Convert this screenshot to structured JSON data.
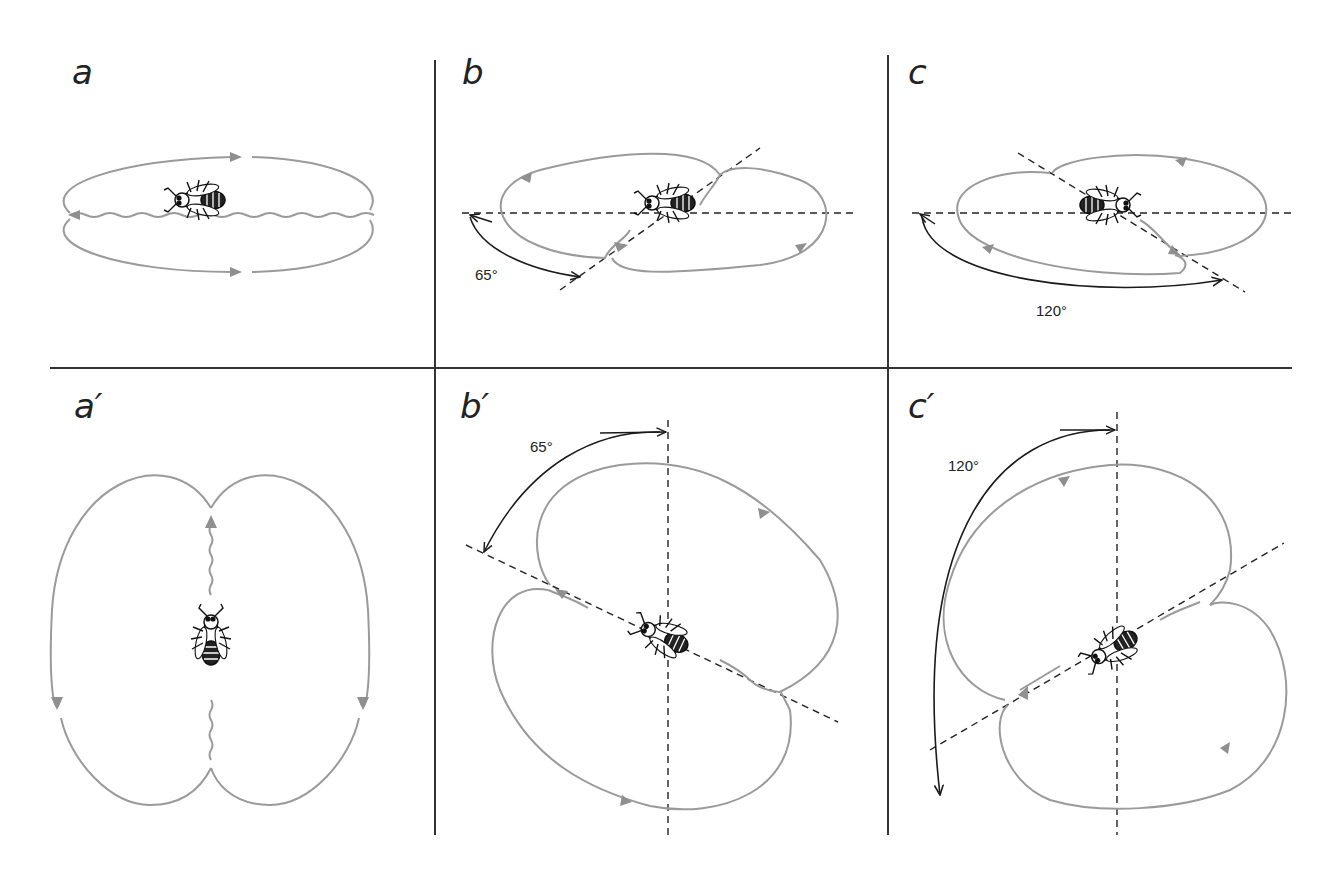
{
  "figure": {
    "colors": {
      "loop": "#9a9a9a",
      "arrowhead": "#8f8f8f",
      "reference_line": "#222222",
      "angle_arc": "#1a1a1a",
      "divider": "#333333",
      "background": "#ffffff"
    },
    "panels": [
      {
        "id": "a",
        "label": "a",
        "angle": null,
        "angle_label": "",
        "row": "top",
        "reference": "none"
      },
      {
        "id": "b",
        "label": "b",
        "angle": 65,
        "angle_label": "65°",
        "row": "top",
        "reference": "horizontal"
      },
      {
        "id": "c",
        "label": "c",
        "angle": 120,
        "angle_label": "120°",
        "row": "top",
        "reference": "horizontal"
      },
      {
        "id": "a2",
        "label": "a′",
        "angle": 0,
        "angle_label": "",
        "row": "bottom",
        "reference": "vertical"
      },
      {
        "id": "b2",
        "label": "b′",
        "angle": 65,
        "angle_label": "65°",
        "row": "bottom",
        "reference": "vertical"
      },
      {
        "id": "c2",
        "label": "c′",
        "angle": 120,
        "angle_label": "120°",
        "row": "bottom",
        "reference": "vertical"
      }
    ]
  }
}
